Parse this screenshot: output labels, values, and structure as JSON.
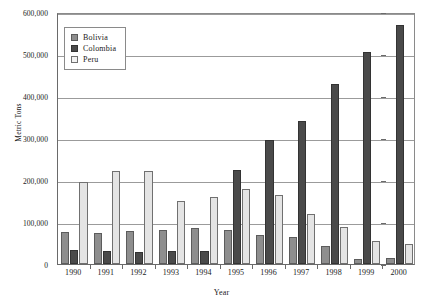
{
  "chart_data": {
    "type": "bar",
    "title": "",
    "xlabel": "Year",
    "ylabel": "Metric Tons",
    "categories": [
      "1990",
      "1991",
      "1992",
      "1993",
      "1994",
      "1995",
      "1996",
      "1997",
      "1998",
      "1999",
      "2000"
    ],
    "series": [
      {
        "name": "Bolivia",
        "color": "#8e8e8e",
        "values": [
          77000,
          74000,
          78000,
          80000,
          85000,
          80000,
          70000,
          64000,
          42000,
          13000,
          14000
        ]
      },
      {
        "name": "Colombia",
        "color": "#4a4a4a",
        "values": [
          33000,
          30000,
          29000,
          31000,
          32000,
          225000,
          295000,
          340000,
          428000,
          505000,
          570000
        ]
      },
      {
        "name": "Peru",
        "color": "#e4e4e4",
        "values": [
          196000,
          222000,
          221000,
          151000,
          159000,
          178000,
          165000,
          120000,
          88000,
          55000,
          48000
        ]
      }
    ],
    "ylim": [
      0,
      600000
    ],
    "ytick_values": [
      0,
      100000,
      200000,
      300000,
      400000,
      500000,
      600000
    ],
    "ytick_labels": [
      "0",
      "100,000",
      "200,000",
      "300,000",
      "400,000",
      "500,000",
      "600,000"
    ],
    "grid": true,
    "legend_position": "top-left",
    "legend_entries": [
      "Bolivia",
      "Colombia",
      "Peru"
    ]
  }
}
